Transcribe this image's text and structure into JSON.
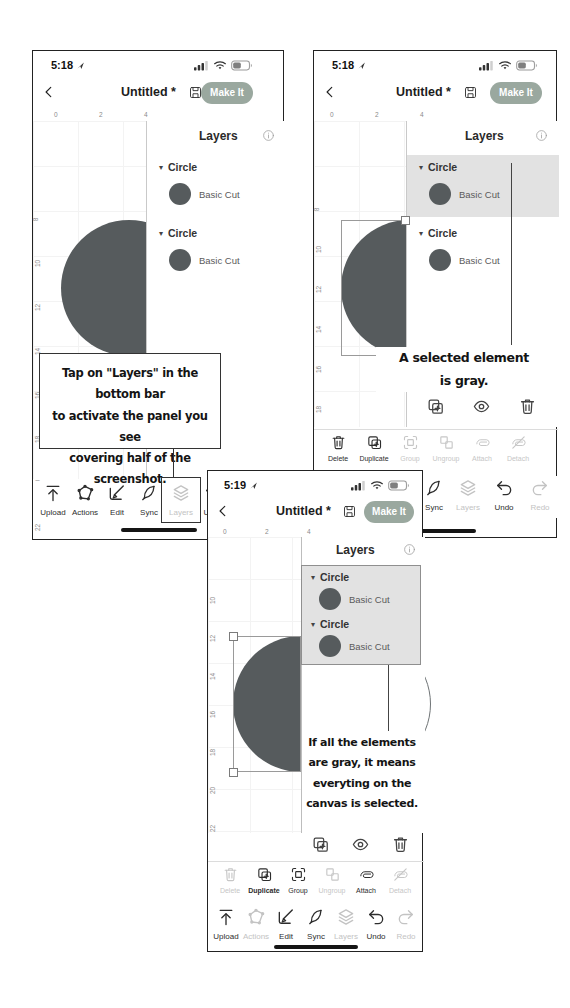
{
  "colors": {
    "make_it_bg": "#9aa89f",
    "circle_fill": "#565b5d",
    "selected_row_bg": "#e2e2e2"
  },
  "icons": {
    "chevron_down": "▾"
  },
  "phone_a": {
    "status_time": "5:18",
    "title": "Untitled *",
    "make_it_label": "Make It",
    "panel_title": "Layers",
    "ruler_h": [
      "0",
      "2",
      "4"
    ],
    "ruler_v": [
      "8",
      "10",
      "12",
      "14",
      "16",
      "18",
      "20",
      "22"
    ],
    "layers": [
      {
        "group": "Circle",
        "item": "Basic Cut"
      },
      {
        "group": "Circle",
        "item": "Basic Cut"
      }
    ],
    "annotation": [
      "Tap on \"Layers\" in the bottom bar",
      "to activate the panel you see",
      "covering half of the screenshot."
    ],
    "toolbar": [
      {
        "label": "Upload",
        "enabled": true
      },
      {
        "label": "Actions",
        "enabled": true
      },
      {
        "label": "Edit",
        "enabled": true
      },
      {
        "label": "Sync",
        "enabled": true
      },
      {
        "label": "Layers",
        "enabled": false
      },
      {
        "label": "Undo",
        "enabled": true
      },
      {
        "label": "Redo",
        "enabled": false
      }
    ]
  },
  "phone_b": {
    "status_time": "5:18",
    "title": "Untitled *",
    "make_it_label": "Make It",
    "panel_title": "Layers",
    "ruler_h": [
      "0",
      "2",
      "4"
    ],
    "ruler_v": [
      "8",
      "10",
      "12",
      "14",
      "16",
      "18",
      "20",
      "22"
    ],
    "layers": [
      {
        "group": "Circle",
        "item": "Basic Cut",
        "selected": true
      },
      {
        "group": "Circle",
        "item": "Basic Cut",
        "selected": false
      }
    ],
    "annotation": [
      "A selected element",
      "is gray."
    ],
    "context_toolbar": [
      {
        "label": "Delete",
        "enabled": true
      },
      {
        "label": "Duplicate",
        "enabled": true
      },
      {
        "label": "Group",
        "enabled": false
      },
      {
        "label": "Ungroup",
        "enabled": false
      },
      {
        "label": "Attach",
        "enabled": false
      },
      {
        "label": "Detach",
        "enabled": false
      }
    ],
    "toolbar": [
      {
        "label": "Upload",
        "enabled": true
      },
      {
        "label": "Actions",
        "enabled": true
      },
      {
        "label": "Edit",
        "enabled": true
      },
      {
        "label": "Sync",
        "enabled": true
      },
      {
        "label": "Layers",
        "enabled": false
      },
      {
        "label": "Undo",
        "enabled": true
      },
      {
        "label": "Redo",
        "enabled": false
      }
    ]
  },
  "phone_c": {
    "status_time": "5:19",
    "title": "Untitled *",
    "make_it_label": "Make It",
    "panel_title": "Layers",
    "ruler_h": [
      "0",
      "2",
      "4"
    ],
    "ruler_v": [
      "10",
      "12",
      "14",
      "16",
      "18",
      "20",
      "22",
      "24"
    ],
    "layers": [
      {
        "group": "Circle",
        "item": "Basic Cut",
        "selected": true
      },
      {
        "group": "Circle",
        "item": "Basic Cut",
        "selected": true
      }
    ],
    "annotation": [
      "If all the elements",
      "are gray, it means",
      "everyting on the",
      "canvas is selected."
    ],
    "context_toolbar": [
      {
        "label": "Delete",
        "enabled": false
      },
      {
        "label": "Duplicate",
        "enabled": true
      },
      {
        "label": "Group",
        "enabled": true
      },
      {
        "label": "Ungroup",
        "enabled": false
      },
      {
        "label": "Attach",
        "enabled": true
      },
      {
        "label": "Detach",
        "enabled": false
      }
    ],
    "toolbar": [
      {
        "label": "Upload",
        "enabled": true
      },
      {
        "label": "Actions",
        "enabled": false
      },
      {
        "label": "Edit",
        "enabled": true
      },
      {
        "label": "Sync",
        "enabled": true
      },
      {
        "label": "Layers",
        "enabled": false
      },
      {
        "label": "Undo",
        "enabled": true
      },
      {
        "label": "Redo",
        "enabled": false
      }
    ]
  }
}
